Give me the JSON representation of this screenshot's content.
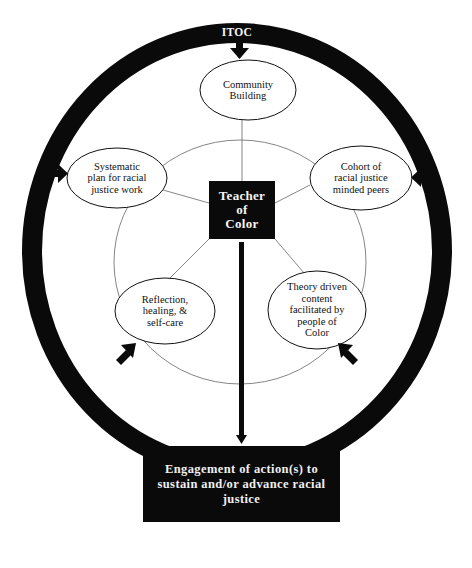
{
  "diagram": {
    "ring_label": "ITOC",
    "center": "Teacher\nof\nColor",
    "nodes": [
      {
        "id": "community",
        "label": "Community\nBuilding"
      },
      {
        "id": "systematic",
        "label": "Systematic\nplan for racial\njustice work"
      },
      {
        "id": "cohort",
        "label": "Cohort of\nracial justice\nminded peers"
      },
      {
        "id": "reflection",
        "label": "Reflection,\nhealing, &\nself-care"
      },
      {
        "id": "theory",
        "label": "Theory driven\ncontent\nfacilitated by\npeople of\nColor"
      }
    ],
    "outcome": "Engagement of action(s) to sustain and/or advance racial justice",
    "colors": {
      "ring": "#0a0a0a",
      "box": "#0a0a0a",
      "box_text": "#f5f5f5",
      "lines": "#555555",
      "background": "#ffffff"
    }
  }
}
